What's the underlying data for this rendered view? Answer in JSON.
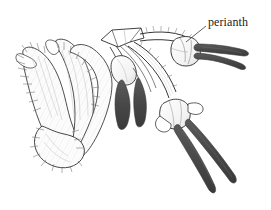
{
  "figure": {
    "background_color": "#ffffff",
    "width": 271,
    "height": 210,
    "style": "pen-and-ink stipple line drawing"
  },
  "annotations": [
    {
      "id": "perianth",
      "label": "perianth",
      "text_x": 208,
      "text_y": 16,
      "leader_from": [
        206,
        26
      ],
      "leader_to": [
        186,
        42
      ],
      "points_to": "upper-right perianth cup"
    }
  ],
  "colors": {
    "outline": "#2b2b2b",
    "anther_dark": "#4a4a4a",
    "anther_dark_edge": "#333333",
    "shade_light": "#d8d8d8",
    "shade_mid": "#bdbdbd",
    "hair_stroke": "#6f6f6f",
    "paper": "#ffffff",
    "text": "#1a1a1a"
  },
  "structures": {
    "bract": {
      "name": "hairy bract (spathe)",
      "location": "left",
      "fill": "white with fine hair stippling",
      "bbox": [
        18,
        38,
        90,
        125
      ]
    },
    "node": {
      "name": "branching node",
      "location": "upper center",
      "bbox": [
        100,
        28,
        45,
        22
      ]
    },
    "pedicels": {
      "name": "arching pedicels with bristles",
      "count": 4,
      "location": "center to right"
    },
    "perianth_upper": {
      "name": "perianth cup upper right",
      "bbox": [
        168,
        36,
        30,
        30
      ]
    },
    "perianth_lower": {
      "name": "perianth cup lower right",
      "bbox": [
        160,
        96,
        34,
        32
      ]
    },
    "anthers": {
      "name": "dark exserted anthers",
      "color": "#4a4a4a",
      "groups": [
        {
          "id": "anthers-upper-right",
          "count": 2,
          "direction": "right"
        },
        {
          "id": "anthers-center",
          "count": 2,
          "direction": "down"
        },
        {
          "id": "anthers-lower-right",
          "count": 2,
          "direction": "down-right"
        }
      ]
    }
  }
}
